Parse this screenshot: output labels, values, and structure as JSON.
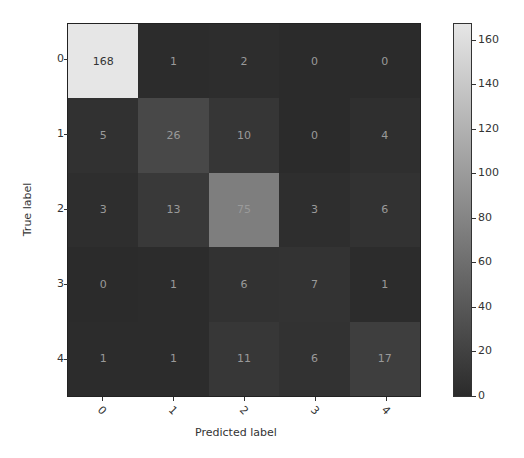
{
  "chart_data": {
    "type": "heatmap",
    "title": "",
    "xlabel": "Predicted label",
    "ylabel": "True label",
    "x_categories": [
      "0",
      "1",
      "2",
      "3",
      "4"
    ],
    "y_categories": [
      "0",
      "1",
      "2",
      "3",
      "4"
    ],
    "matrix": [
      [
        168,
        1,
        2,
        0,
        0
      ],
      [
        5,
        26,
        10,
        0,
        4
      ],
      [
        3,
        13,
        75,
        3,
        6
      ],
      [
        0,
        1,
        6,
        7,
        1
      ],
      [
        1,
        1,
        11,
        6,
        17
      ]
    ],
    "colorbar": {
      "ticks": [
        0,
        20,
        40,
        60,
        80,
        100,
        120,
        140,
        160
      ],
      "range": [
        0,
        168
      ],
      "colormap": "grayscale",
      "low_color": "#2b2b2b",
      "high_color": "#e6e6e6"
    },
    "x_tick_rotation": 45,
    "grid": false,
    "legend_position": "right colorbar"
  }
}
